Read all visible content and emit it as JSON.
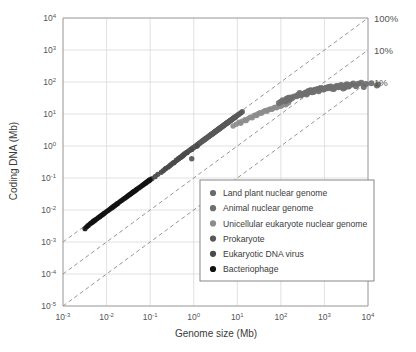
{
  "chart_data": {
    "type": "scatter",
    "title": "",
    "xlabel": "Genome size (Mb)",
    "ylabel": "Coding DNA (Mb)",
    "xscale": "log",
    "yscale": "log",
    "xlim": [
      0.001,
      10000
    ],
    "ylim": [
      1e-05,
      10000
    ],
    "grid": true,
    "xticks": [
      0.001,
      0.01,
      0.1,
      1,
      10,
      100,
      1000,
      10000
    ],
    "xtick_labels": [
      "10-3",
      "10-2",
      "10-1",
      "10 0",
      "10 1",
      "10 2",
      "10 3",
      "10 4"
    ],
    "xtick_mantissa": [
      "10",
      "10",
      "10",
      "10",
      "10",
      "10",
      "10",
      "10"
    ],
    "xtick_exponent": [
      "-3",
      "-2",
      "-1",
      "0",
      "1",
      "2",
      "3",
      "4"
    ],
    "yticks": [
      1e-05,
      0.0001,
      0.001,
      0.01,
      0.1,
      1,
      10,
      100,
      1000,
      10000
    ],
    "ytick_mantissa": [
      "10",
      "10",
      "10",
      "10",
      "10",
      "10",
      "10",
      "10",
      "10",
      "10"
    ],
    "ytick_exponent": [
      "-5",
      "-4",
      "-3",
      "-2",
      "-1",
      "0",
      "1",
      "2",
      "3",
      "4"
    ],
    "reference_lines": [
      {
        "label": "100%",
        "ratio": 1.0,
        "style": "dashed"
      },
      {
        "label": "10%",
        "ratio": 0.1,
        "style": "dashed"
      },
      {
        "label": "1%",
        "ratio": 0.01,
        "style": "dashed"
      }
    ],
    "legend_position": "lower-right-inside",
    "series": [
      {
        "name": "Land plant nuclear genome",
        "color": "#6b6b6b",
        "points": [
          [
            125,
            26
          ],
          [
            135,
            30
          ],
          [
            150,
            32
          ],
          [
            160,
            28
          ],
          [
            245,
            39
          ],
          [
            270,
            45
          ],
          [
            370,
            47
          ],
          [
            430,
            52
          ],
          [
            480,
            55
          ],
          [
            520,
            48
          ],
          [
            600,
            57
          ],
          [
            700,
            60
          ],
          [
            760,
            62
          ],
          [
            850,
            65
          ],
          [
            950,
            58
          ],
          [
            1100,
            66
          ],
          [
            1250,
            70
          ],
          [
            1400,
            72
          ],
          [
            1650,
            60
          ],
          [
            1900,
            75
          ],
          [
            2100,
            68
          ],
          [
            2400,
            80
          ],
          [
            2700,
            63
          ],
          [
            3000,
            78
          ],
          [
            3300,
            85
          ],
          [
            3600,
            72
          ],
          [
            4100,
            82
          ],
          [
            4600,
            90
          ],
          [
            5300,
            74
          ],
          [
            6000,
            88
          ],
          [
            7000,
            95
          ],
          [
            8000,
            70
          ],
          [
            9000,
            86
          ],
          [
            12000,
            92
          ],
          [
            16000,
            78
          ],
          [
            17000,
            83
          ]
        ]
      },
      {
        "name": "Animal nuclear genome",
        "color": "#6f6f6f",
        "points": [
          [
            90,
            22
          ],
          [
            100,
            24
          ],
          [
            110,
            27
          ],
          [
            130,
            25
          ],
          [
            170,
            33
          ],
          [
            180,
            31
          ],
          [
            200,
            35
          ],
          [
            230,
            36
          ],
          [
            260,
            40
          ],
          [
            290,
            38
          ],
          [
            320,
            42
          ],
          [
            350,
            44
          ],
          [
            390,
            41
          ],
          [
            420,
            46
          ],
          [
            460,
            50
          ],
          [
            500,
            53
          ],
          [
            560,
            49
          ],
          [
            620,
            54
          ],
          [
            680,
            56
          ],
          [
            740,
            51
          ],
          [
            800,
            58
          ],
          [
            880,
            61
          ],
          [
            960,
            59
          ],
          [
            1050,
            63
          ],
          [
            1200,
            64
          ],
          [
            1300,
            67
          ],
          [
            1500,
            62
          ],
          [
            1700,
            69
          ],
          [
            2000,
            73
          ],
          [
            2300,
            71
          ],
          [
            2600,
            76
          ],
          [
            2900,
            66
          ],
          [
            3100,
            79
          ],
          [
            3300,
            74
          ],
          [
            3500,
            77
          ]
        ]
      },
      {
        "name": "Unicellular eukaryote nuclear genome",
        "color": "#8c8c8c",
        "points": [
          [
            8,
            4.2
          ],
          [
            9.5,
            4.8
          ],
          [
            11,
            5.5
          ],
          [
            12,
            5.1
          ],
          [
            13,
            6.0
          ],
          [
            15,
            6.6
          ],
          [
            16,
            6.2
          ],
          [
            18,
            7.3
          ],
          [
            20,
            8.0
          ],
          [
            22,
            7.6
          ],
          [
            24,
            8.8
          ],
          [
            26,
            9.4
          ],
          [
            28,
            9.0
          ],
          [
            30,
            10.2
          ],
          [
            33,
            11.0
          ],
          [
            36,
            10.5
          ],
          [
            40,
            12.0
          ],
          [
            44,
            12.8
          ],
          [
            48,
            12.2
          ],
          [
            52,
            13.6
          ],
          [
            57,
            14.5
          ],
          [
            62,
            13.9
          ],
          [
            68,
            15.4
          ],
          [
            74,
            16.3
          ],
          [
            80,
            15.7
          ],
          [
            88,
            17.2
          ],
          [
            95,
            18.1
          ],
          [
            100,
            17.5
          ],
          [
            110,
            19.0
          ],
          [
            120,
            20.2
          ],
          [
            130,
            19.4
          ],
          [
            140,
            21.5
          ],
          [
            150,
            22.4
          ]
        ]
      },
      {
        "name": "Prokaryote",
        "color": "#585858",
        "points": [
          [
            0.55,
            0.5
          ],
          [
            0.6,
            0.55
          ],
          [
            0.65,
            0.6
          ],
          [
            0.7,
            0.63
          ],
          [
            0.75,
            0.68
          ],
          [
            0.8,
            0.72
          ],
          [
            0.85,
            0.77
          ],
          [
            0.9,
            0.81
          ],
          [
            0.95,
            0.86
          ],
          [
            1.0,
            0.9
          ],
          [
            1.1,
            0.99
          ],
          [
            1.2,
            1.08
          ],
          [
            1.3,
            1.17
          ],
          [
            1.4,
            1.26
          ],
          [
            1.5,
            1.35
          ],
          [
            1.6,
            1.44
          ],
          [
            1.7,
            1.53
          ],
          [
            1.8,
            1.62
          ],
          [
            1.9,
            1.71
          ],
          [
            2.0,
            1.8
          ],
          [
            2.2,
            1.98
          ],
          [
            2.4,
            2.16
          ],
          [
            2.6,
            2.34
          ],
          [
            2.8,
            2.52
          ],
          [
            3.0,
            2.7
          ],
          [
            3.2,
            2.88
          ],
          [
            3.4,
            3.06
          ],
          [
            3.6,
            3.24
          ],
          [
            3.8,
            3.42
          ],
          [
            4.0,
            3.6
          ],
          [
            4.3,
            3.87
          ],
          [
            4.6,
            4.14
          ],
          [
            4.9,
            4.41
          ],
          [
            5.2,
            4.68
          ],
          [
            5.5,
            4.95
          ],
          [
            5.8,
            5.22
          ],
          [
            6.1,
            5.49
          ],
          [
            6.5,
            5.85
          ],
          [
            6.9,
            6.21
          ],
          [
            7.3,
            6.57
          ],
          [
            7.7,
            6.93
          ],
          [
            8.2,
            7.38
          ],
          [
            8.7,
            7.83
          ],
          [
            9.2,
            8.28
          ],
          [
            9.8,
            8.82
          ],
          [
            10.5,
            9.45
          ],
          [
            11.2,
            10.1
          ],
          [
            12.0,
            10.8
          ],
          [
            13.0,
            11.7
          ],
          [
            0.5,
            0.45
          ],
          [
            0.45,
            0.41
          ],
          [
            0.4,
            0.36
          ],
          [
            1.05,
            0.94
          ],
          [
            1.25,
            1.12
          ],
          [
            1.45,
            1.3
          ],
          [
            1.65,
            1.49
          ],
          [
            1.85,
            1.66
          ],
          [
            2.1,
            1.89
          ],
          [
            2.3,
            2.07
          ],
          [
            2.5,
            2.25
          ],
          [
            2.7,
            2.43
          ],
          [
            2.9,
            2.61
          ],
          [
            3.1,
            2.79
          ],
          [
            3.3,
            2.97
          ],
          [
            3.5,
            3.15
          ],
          [
            3.7,
            3.33
          ],
          [
            3.9,
            3.51
          ],
          [
            4.2,
            3.78
          ],
          [
            4.5,
            4.05
          ],
          [
            4.8,
            4.32
          ],
          [
            5.1,
            4.59
          ],
          [
            5.4,
            4.86
          ],
          [
            5.7,
            5.13
          ],
          [
            6.0,
            5.4
          ],
          [
            6.3,
            5.67
          ],
          [
            6.7,
            6.03
          ],
          [
            7.1,
            6.39
          ],
          [
            7.5,
            6.75
          ],
          [
            8.0,
            7.2
          ],
          [
            8.5,
            7.65
          ],
          [
            9.0,
            8.1
          ],
          [
            1.15,
            1.0
          ],
          [
            1.35,
            1.2
          ],
          [
            1.55,
            1.4
          ],
          [
            1.75,
            1.58
          ],
          [
            1.95,
            1.75
          ],
          [
            2.15,
            1.93
          ],
          [
            2.35,
            2.12
          ],
          [
            2.55,
            2.29
          ],
          [
            2.75,
            2.48
          ],
          [
            2.95,
            2.65
          ],
          [
            3.15,
            2.84
          ],
          [
            3.45,
            3.1
          ],
          [
            3.75,
            3.38
          ],
          [
            4.05,
            3.65
          ],
          [
            4.35,
            3.92
          ],
          [
            4.65,
            4.18
          ],
          [
            5.0,
            4.5
          ],
          [
            5.6,
            5.04
          ],
          [
            6.2,
            5.58
          ],
          [
            7.0,
            6.3
          ],
          [
            0.9,
            0.4
          ]
        ]
      },
      {
        "name": "Eukaryotic DNA virus",
        "color": "#4a4a4a",
        "points": [
          [
            0.18,
            0.15
          ],
          [
            0.2,
            0.17
          ],
          [
            0.23,
            0.2
          ],
          [
            0.26,
            0.22
          ],
          [
            0.3,
            0.26
          ],
          [
            0.33,
            0.29
          ],
          [
            0.36,
            0.31
          ],
          [
            0.4,
            0.35
          ],
          [
            0.15,
            0.13
          ],
          [
            0.13,
            0.11
          ],
          [
            0.11,
            0.095
          ],
          [
            0.095,
            0.082
          ],
          [
            0.08,
            0.07
          ],
          [
            0.5,
            0.44
          ],
          [
            0.6,
            0.53
          ],
          [
            0.7,
            0.62
          ],
          [
            0.22,
            0.19
          ],
          [
            0.28,
            0.24
          ],
          [
            0.45,
            0.39
          ],
          [
            0.35,
            0.3
          ],
          [
            1.2,
            1.0
          ],
          [
            0.9,
            0.78
          ],
          [
            0.55,
            0.48
          ]
        ]
      },
      {
        "name": "Bacteriophage",
        "color": "#111111",
        "points": [
          [
            0.0045,
            0.004
          ],
          [
            0.005,
            0.0045
          ],
          [
            0.006,
            0.0053
          ],
          [
            0.007,
            0.0062
          ],
          [
            0.008,
            0.0071
          ],
          [
            0.009,
            0.008
          ],
          [
            0.01,
            0.0089
          ],
          [
            0.012,
            0.0107
          ],
          [
            0.014,
            0.0125
          ],
          [
            0.016,
            0.0143
          ],
          [
            0.018,
            0.016
          ],
          [
            0.02,
            0.018
          ],
          [
            0.024,
            0.0215
          ],
          [
            0.028,
            0.025
          ],
          [
            0.032,
            0.0287
          ],
          [
            0.036,
            0.032
          ],
          [
            0.04,
            0.036
          ],
          [
            0.045,
            0.04
          ],
          [
            0.05,
            0.045
          ],
          [
            0.06,
            0.053
          ],
          [
            0.07,
            0.062
          ],
          [
            0.08,
            0.071
          ],
          [
            0.09,
            0.08
          ],
          [
            0.1,
            0.089
          ],
          [
            0.0035,
            0.003
          ],
          [
            0.0038,
            0.0033
          ],
          [
            0.0042,
            0.0037
          ],
          [
            0.0055,
            0.0049
          ],
          [
            0.0065,
            0.0058
          ],
          [
            0.0075,
            0.0067
          ],
          [
            0.0085,
            0.0076
          ],
          [
            0.011,
            0.0098
          ],
          [
            0.013,
            0.0116
          ],
          [
            0.015,
            0.0134
          ],
          [
            0.017,
            0.0152
          ],
          [
            0.022,
            0.0197
          ],
          [
            0.026,
            0.0233
          ],
          [
            0.03,
            0.0269
          ],
          [
            0.034,
            0.0304
          ],
          [
            0.038,
            0.034
          ],
          [
            0.043,
            0.0385
          ],
          [
            0.048,
            0.043
          ],
          [
            0.055,
            0.049
          ],
          [
            0.065,
            0.058
          ],
          [
            0.075,
            0.067
          ],
          [
            0.085,
            0.076
          ],
          [
            0.095,
            0.085
          ],
          [
            0.0032,
            0.0026
          ],
          [
            0.0048,
            0.0042
          ],
          [
            0.0052,
            0.0046
          ]
        ]
      }
    ]
  },
  "axes": {
    "ylabel": "Coding DNA (Mb)",
    "xlabel": "Genome size (Mb)"
  },
  "legend": {
    "entries": [
      {
        "label": "Land plant nuclear genome",
        "color": "#6b6b6b"
      },
      {
        "label": "Animal nuclear genome",
        "color": "#6f6f6f"
      },
      {
        "label": "Unicellular eukaryote nuclear genome",
        "color": "#8c8c8c"
      },
      {
        "label": "Prokaryote",
        "color": "#585858"
      },
      {
        "label": "Eukaryotic DNA virus",
        "color": "#4a4a4a"
      },
      {
        "label": "Bacteriophage",
        "color": "#111111"
      }
    ]
  },
  "annotations": {
    "pct_100": "100%",
    "pct_10": "10%",
    "pct_1": "1%"
  }
}
